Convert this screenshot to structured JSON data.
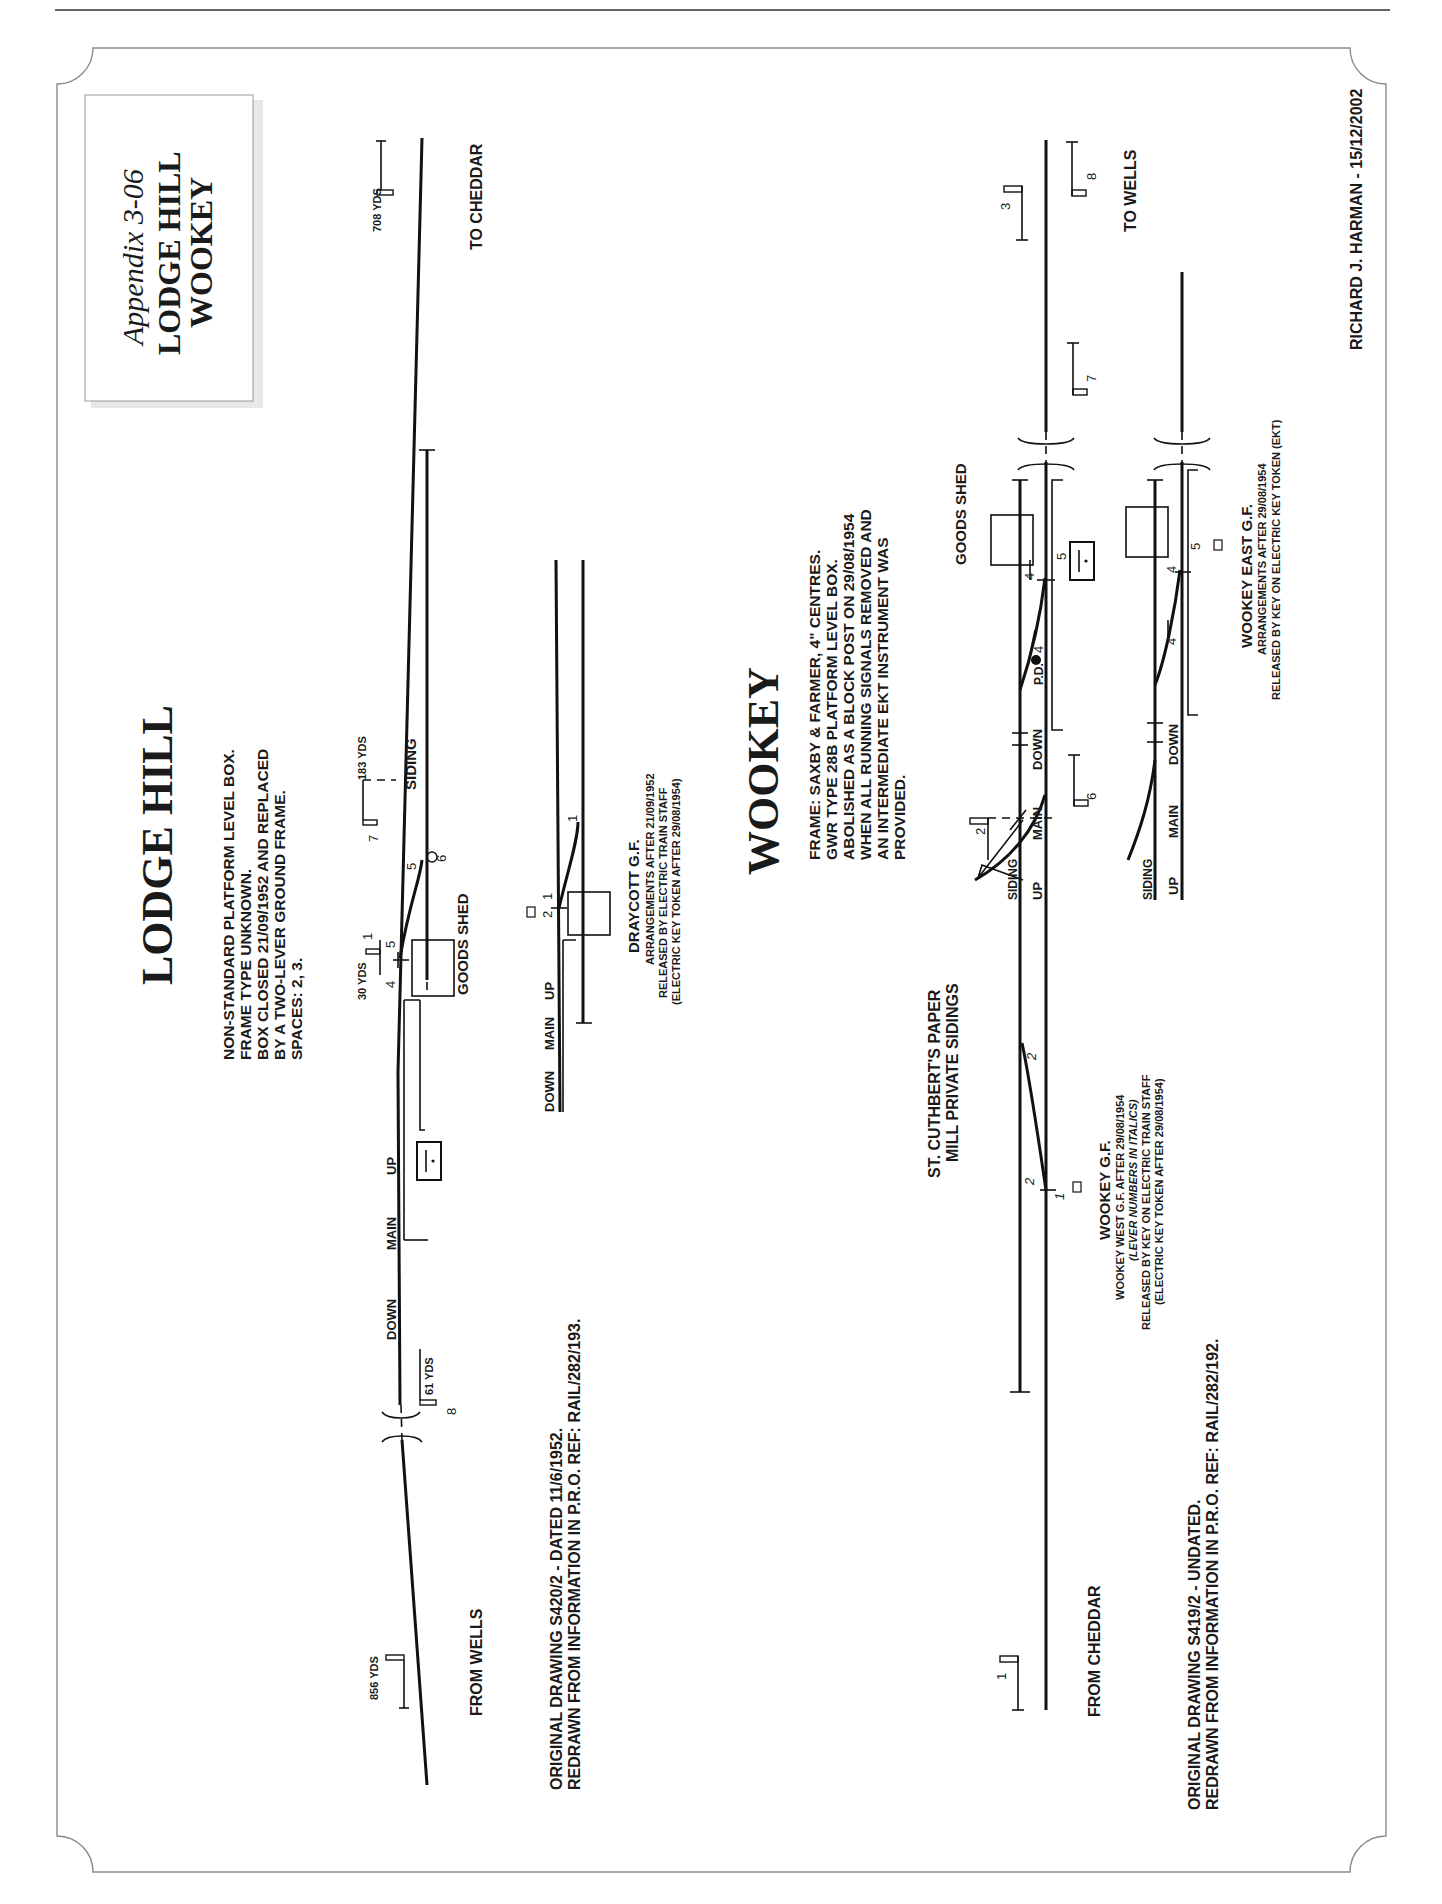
{
  "page": {
    "title_box": {
      "appendix": "Appendix 3-06",
      "line1": "LODGE HILL",
      "line2": "WOOKEY"
    },
    "author_credit": "RICHARD J. HARMAN - 15/12/2002"
  },
  "lodge_hill": {
    "heading": "LODGE HILL",
    "notes": [
      "NON-STANDARD PLATFORM LEVEL BOX.",
      "FRAME TYPE UNKNOWN.",
      "BOX CLOSED 21/09/1952 AND REPLACED",
      "BY A TWO-LEVER GROUND FRAME.",
      "SPACES: 2, 3."
    ],
    "to_label": "TO CHEDDAR",
    "from_label": "FROM WELLS",
    "main_labels": {
      "down": "DOWN",
      "main": "MAIN",
      "up": "UP"
    },
    "siding_label": "SIDING",
    "goods_shed": "GOODS SHED",
    "distances": {
      "d708": "708 YDS",
      "d183": "183 YDS",
      "d30": "30 YDS",
      "d61": "61 YDS",
      "d856": "856 YDS"
    },
    "levers": {
      "l1": "1",
      "l4": "4",
      "l5a": "5",
      "l5b": "5",
      "l6": "6",
      "l7": "7",
      "l8": "8"
    },
    "source": [
      "ORIGINAL DRAWING S420/2 - DATED 11/6/1952.",
      "REDRAWN FROM INFORMATION IN P.R.O. REF: RAIL/282/193."
    ]
  },
  "draycott": {
    "title": "DRAYCOTT G.F.",
    "notes": [
      "ARRANGEMENTS AFTER 21/09/1952",
      "RELEASED BY ELECTRIC TRAIN STAFF",
      "(ELECTRIC KEY TOKEN AFTER 29/08/1954)"
    ],
    "main_labels": {
      "down": "DOWN",
      "main": "MAIN",
      "up": "UP"
    },
    "levers": {
      "l1a": "1",
      "l1b": "1",
      "l2": "2"
    }
  },
  "wookey": {
    "heading": "WOOKEY",
    "notes": [
      "FRAME: SAXBY & FARMER, 4\" CENTRES.",
      "GWR TYPE 28B PLATFORM LEVEL BOX.",
      "ABOLISHED AS A BLOCK POST ON 29/08/1954",
      "WHEN ALL RUNNING SIGNALS REMOVED AND",
      "AN INTERMEDIATE EKT INSTRUMENT WAS",
      "PROVIDED."
    ],
    "to_label": "TO WELLS",
    "from_label": "FROM CHEDDAR",
    "main_labels": {
      "up": "UP",
      "main": "MAIN",
      "down": "DOWN"
    },
    "siding_label": "SIDING",
    "goods_shed": "GOODS SHED",
    "private_sidings": [
      "ST. CUTHBERT'S PAPER",
      "MILL PRIVATE SIDINGS"
    ],
    "pd_label": "P.D.",
    "levers": {
      "l1": "1",
      "l2": "2",
      "l3": "3",
      "l4a": "4",
      "l4b": "4",
      "l5": "5",
      "l6": "6",
      "l7": "7",
      "l8": "8",
      "i1": "1",
      "i2a": "2",
      "i2b": "2"
    },
    "west_gf": {
      "title": "WOOKEY G.F.",
      "notes": [
        "WOOKEY WEST G.F. AFTER 29/08/1954",
        "(LEVER NUMBERS IN ITALICS)",
        "RELEASED BY KEY ON ELECTRIC TRAIN STAFF",
        "(ELECTRIC KEY TOKEN AFTER 29/08/1954)"
      ]
    },
    "source": [
      "ORIGINAL DRAWING S419/2 - UNDATED.",
      "REDRAWN FROM INFORMATION IN P.R.O. REF: RAIL/282/192."
    ]
  },
  "wookey_east": {
    "title": "WOOKEY EAST G.F.",
    "notes": [
      "ARRANGEMENTS AFTER 29/08/1954",
      "RELEASED BY KEY ON ELECTRIC KEY TOKEN (EKT)"
    ],
    "siding_label": "SIDING",
    "main_labels": {
      "up": "UP",
      "main": "MAIN",
      "down": "DOWN"
    },
    "levers": {
      "l4a": "4",
      "l4b": "4",
      "l5": "5"
    }
  }
}
